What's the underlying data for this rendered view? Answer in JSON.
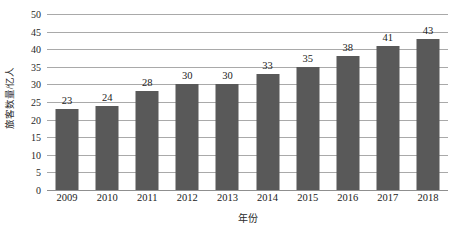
{
  "chart_data": {
    "type": "bar",
    "title": "",
    "subtitle": "",
    "xlabel": "年份",
    "ylabel": "旅客数量/亿人",
    "categories": [
      "2009",
      "2010",
      "2011",
      "2012",
      "2013",
      "2014",
      "2015",
      "2016",
      "2017",
      "2018"
    ],
    "values": [
      23,
      24,
      28,
      30,
      30,
      33,
      35,
      38,
      41,
      43
    ],
    "data_labels": [
      "23",
      "24",
      "28",
      "30",
      "30",
      "33",
      "35",
      "38",
      "41",
      "43"
    ],
    "ylim": [
      0,
      50
    ],
    "ytick_values": [
      0,
      5,
      10,
      15,
      20,
      25,
      30,
      35,
      40,
      45,
      50
    ],
    "ytick_labels": [
      "0",
      "5",
      "10",
      "15",
      "20",
      "25",
      "30",
      "35",
      "40",
      "45",
      "50"
    ],
    "ytick_step": 5,
    "grid": true,
    "grid_axis": "y",
    "legend": false,
    "legend_position": "none",
    "series_color": "#595959",
    "gridline_color": "#a9a9a9",
    "axis_color": "#8f8f8f",
    "background_color": "#ffffff",
    "text_color": "#1b1b1b"
  }
}
